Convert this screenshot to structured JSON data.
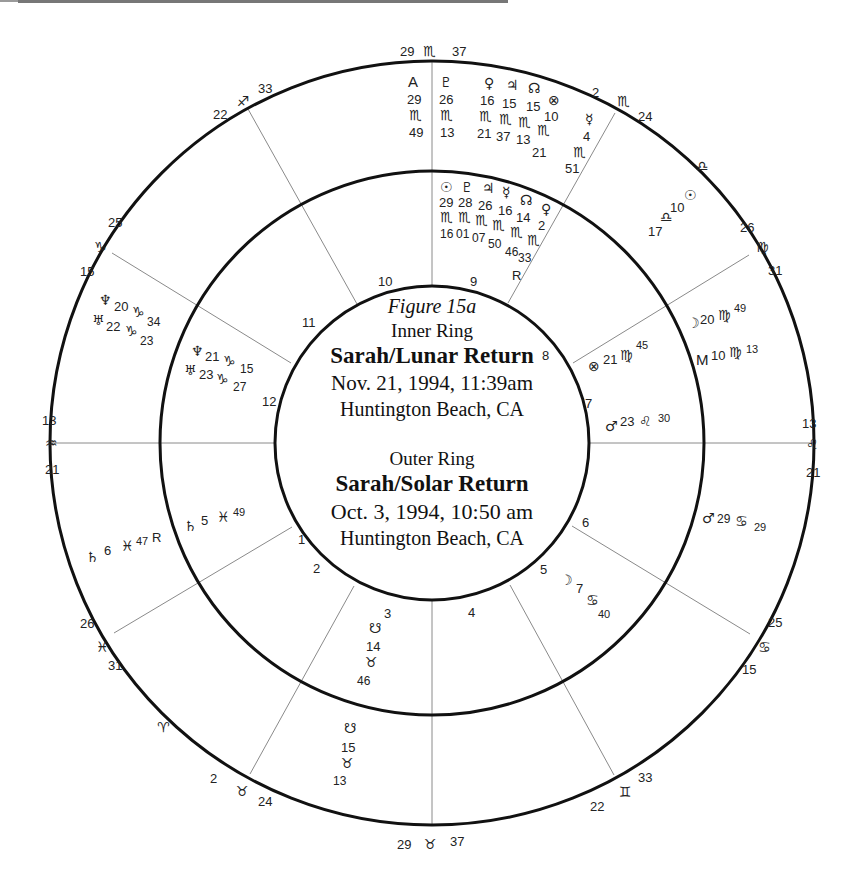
{
  "title_block": {
    "figure": "Figure 15a",
    "inner_label": "Inner Ring",
    "inner_name": "Sarah/Lunar Return",
    "inner_date": "Nov. 21, 1994, 11:39am",
    "inner_place": "Huntington Beach, CA",
    "outer_label": "Outer Ring",
    "outer_name": "Sarah/Solar Return",
    "outer_date": "Oct. 3, 1994, 10:50 am",
    "outer_place": "Huntington Beach, CA"
  },
  "outer_cusps": {
    "mc": {
      "deg": "29",
      "sign": "♏",
      "min": "37"
    },
    "c11": {
      "deg": "22",
      "sign": "♐",
      "min": "33"
    },
    "c12": {
      "deg": "25",
      "sign": "♑",
      "min": "15"
    },
    "asc": {
      "deg": "13",
      "sign": "♒",
      "min": "21"
    },
    "c2": {
      "deg": "26",
      "sign": "♓",
      "min": "31"
    },
    "aries": {
      "sign": "♈"
    },
    "c3": {
      "deg": "2",
      "sign": "♉",
      "min": "24"
    },
    "ic": {
      "deg": "29",
      "sign": "♉",
      "min": "37"
    },
    "c5": {
      "deg": "22",
      "sign": "♊",
      "min": "33"
    },
    "c6": {
      "deg": "25",
      "sign": "♋",
      "min": "15"
    },
    "dsc": {
      "deg": "13",
      "sign": "♌",
      "min": "21"
    },
    "c8": {
      "deg": "26",
      "sign": "♍",
      "min": "31"
    },
    "libra": {
      "sign": "♎"
    },
    "c9": {
      "deg": "2",
      "sign": "♏",
      "min": "24"
    }
  },
  "house_numbers": [
    "1",
    "2",
    "3",
    "4",
    "5",
    "6",
    "7",
    "8",
    "9",
    "10",
    "11",
    "12"
  ],
  "outer_planets": {
    "asc_point": {
      "glyph": "A",
      "deg": "29",
      "sign": "♏",
      "min": "49"
    },
    "pluto": {
      "glyph": "♇",
      "deg": "26",
      "sign": "♏",
      "min": "13"
    },
    "venus": {
      "glyph": "♀",
      "deg": "16",
      "sign": "♏",
      "min": "21"
    },
    "jupiter": {
      "glyph": "♃",
      "deg": "15",
      "sign": "♏",
      "min": "37"
    },
    "node": {
      "glyph": "☊",
      "deg": "15",
      "sign": "♏",
      "min": "13"
    },
    "fortune": {
      "glyph": "⊗",
      "deg": "10",
      "sign": "♏",
      "min": "21"
    },
    "mercury": {
      "glyph": "☿",
      "deg": "4",
      "sign": "♏",
      "min": "51"
    },
    "sun": {
      "glyph": "☉",
      "deg": "10",
      "sign": "♎",
      "min": "17"
    },
    "moon": {
      "glyph": "☽",
      "deg": "20",
      "sign": "♍",
      "min": "49"
    },
    "mc_point": {
      "glyph": "M",
      "deg": "10",
      "sign": "♍",
      "min": "13"
    },
    "mars": {
      "glyph": "♂",
      "deg": "29",
      "sign": "♋",
      "min": "29"
    },
    "south_node": {
      "glyph": "☋",
      "deg": "15",
      "sign": "♉",
      "min": "13"
    },
    "saturn": {
      "glyph": "♄",
      "deg": "6",
      "sign": "♓",
      "min": "47",
      "retro": "R"
    },
    "neptune": {
      "glyph": "♆",
      "deg": "20",
      "sign": "♑",
      "min": "34"
    },
    "uranus": {
      "glyph": "♅",
      "deg": "22",
      "sign": "♑",
      "min": "23"
    }
  },
  "inner_planets": {
    "sun": {
      "glyph": "☉",
      "deg": "29",
      "sign": "♏",
      "min": "16"
    },
    "pluto": {
      "glyph": "♇",
      "deg": "28",
      "sign": "♏",
      "min": "01"
    },
    "jupiter": {
      "glyph": "♃",
      "deg": "26",
      "sign": "♏",
      "min": "07"
    },
    "mercury": {
      "glyph": "☿",
      "deg": "16",
      "sign": "♏",
      "min": "50",
      "retro": "R"
    },
    "node": {
      "glyph": "☊",
      "deg": "14",
      "sign": "♏",
      "min": "46"
    },
    "venus": {
      "glyph": "♀",
      "deg": "2",
      "sign": "♏",
      "min": "33"
    },
    "fortune": {
      "glyph": "⊗",
      "deg": "21",
      "sign": "♍",
      "min": "45"
    },
    "mars": {
      "glyph": "♂",
      "deg": "23",
      "sign": "♌",
      "min": "30"
    },
    "moon": {
      "glyph": "☽",
      "deg": "7",
      "sign": "♋",
      "min": "40"
    },
    "south_node": {
      "glyph": "☋",
      "deg": "14",
      "sign": "♉",
      "min": "46"
    },
    "saturn": {
      "glyph": "♄",
      "deg": "5",
      "sign": "♓",
      "min": "49"
    },
    "neptune": {
      "glyph": "♆",
      "deg": "21",
      "sign": "♑",
      "min": "15"
    },
    "uranus": {
      "glyph": "♅",
      "deg": "23",
      "sign": "♑",
      "min": "27"
    }
  }
}
